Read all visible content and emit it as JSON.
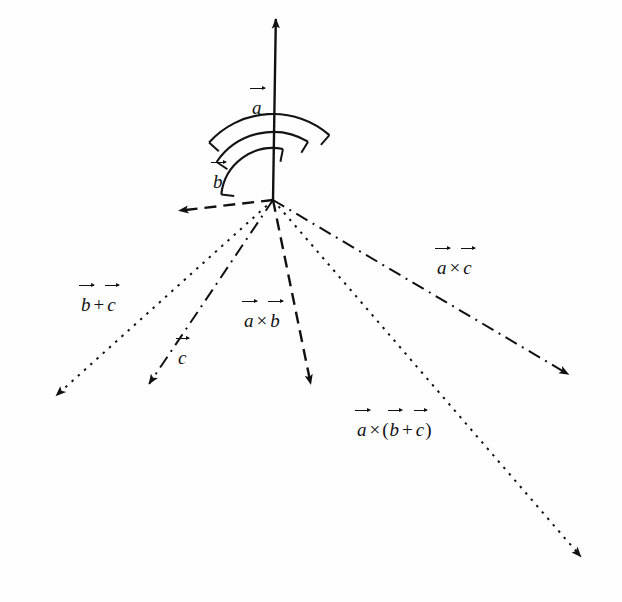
{
  "figure": {
    "type": "vector-diagram",
    "title": "",
    "background_color": "#fefefe",
    "ink_color": "#111111",
    "origin": {
      "x": 273,
      "y": 200
    }
  },
  "labels": {
    "a": {
      "base": "a",
      "text": "a"
    },
    "b": {
      "base": "b",
      "text": "b"
    },
    "c": {
      "base": "c",
      "text": "c"
    },
    "b_plus_c": {
      "text": "b + c",
      "left": "b",
      "op": "+",
      "right": "c"
    },
    "a_cross_b": {
      "text": "a × b",
      "left": "a",
      "op": "×",
      "right": "b"
    },
    "a_cross_c": {
      "text": "a × c",
      "left": "a",
      "op": "×",
      "right": "c"
    },
    "a_cross_b_plus_c": {
      "text": "a × (b + c)",
      "left": "a",
      "op": "×",
      "open": "(",
      "inner_left": "b",
      "inner_op": "+",
      "inner_right": "c",
      "close": ")"
    }
  },
  "vectors": [
    {
      "name": "a",
      "label": "a",
      "style": "solid",
      "from": {
        "x": 273,
        "y": 200
      },
      "to": {
        "x": 276,
        "y": 8
      },
      "label_pos": {
        "x": 251,
        "y": 98
      }
    },
    {
      "name": "b",
      "label": "b",
      "style": "dashed",
      "from": {
        "x": 273,
        "y": 200
      },
      "to": {
        "x": 168,
        "y": 212
      },
      "label_pos": {
        "x": 212,
        "y": 172
      }
    },
    {
      "name": "c",
      "label": "c",
      "style": "dash-dot",
      "from": {
        "x": 273,
        "y": 200
      },
      "to": {
        "x": 143,
        "y": 393
      },
      "label_pos": {
        "x": 177,
        "y": 348
      }
    },
    {
      "name": "b-plus-c",
      "label": "b + c",
      "style": "dotted",
      "from": {
        "x": 273,
        "y": 200
      },
      "to": {
        "x": 48,
        "y": 403
      },
      "label_pos": {
        "x": 80,
        "y": 295
      }
    },
    {
      "name": "a-cross-b",
      "label": "a × b",
      "style": "dashed",
      "from": {
        "x": 273,
        "y": 200
      },
      "to": {
        "x": 313,
        "y": 395
      },
      "label_pos": {
        "x": 243,
        "y": 311
      }
    },
    {
      "name": "a-cross-c",
      "label": "a × c",
      "style": "dash-dot",
      "from": {
        "x": 273,
        "y": 200
      },
      "to": {
        "x": 578,
        "y": 380
      },
      "label_pos": {
        "x": 436,
        "y": 258
      }
    },
    {
      "name": "a-cross-b-plus-c",
      "label": "a × (b + c)",
      "style": "dotted",
      "from": {
        "x": 273,
        "y": 200
      },
      "to": {
        "x": 588,
        "y": 565
      },
      "label_pos": {
        "x": 356,
        "y": 420
      }
    }
  ],
  "arcs": [
    {
      "name": "arc-b-to-a-cross-b",
      "radius": 52,
      "from_deg": 186,
      "to_deg": 281
    },
    {
      "name": "arc-c-to-a-cross-c",
      "radius": 68,
      "from_deg": 214,
      "to_deg": 301
    },
    {
      "name": "arc-bc-to-a-cross-bc",
      "radius": 86,
      "from_deg": 222,
      "to_deg": 311
    }
  ]
}
